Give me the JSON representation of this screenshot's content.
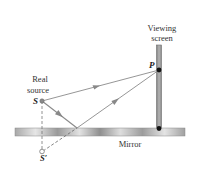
{
  "diagram": {
    "labels": {
      "viewing_screen_line1": "Viewing",
      "viewing_screen_line2": "screen",
      "real_source_line1": "Real",
      "real_source_line2": "source",
      "source": "S",
      "image_source": "S′",
      "point": "P",
      "mirror": "Mirror"
    },
    "elements": {
      "mirror": {
        "label": "Mirror",
        "x1": 15,
        "x2": 185,
        "y": 128,
        "thickness": 8
      },
      "screen": {
        "label": "Viewing screen",
        "x": 159,
        "y_top": 46,
        "y_bottom": 128
      },
      "source_S": {
        "x": 42,
        "y": 101
      },
      "image_S_prime": {
        "x": 42,
        "y": 152
      },
      "point_P": {
        "x": 159,
        "y": 70
      },
      "reflection_point": {
        "x": 77,
        "y": 128
      }
    },
    "rays": [
      {
        "name": "direct-ray",
        "from": "S",
        "to": "P",
        "style": "solid",
        "arrow": true
      },
      {
        "name": "incident-ray",
        "from": "S",
        "to": "reflection_point",
        "style": "solid",
        "arrow": true
      },
      {
        "name": "reflected-ray",
        "from": "reflection_point",
        "to": "P",
        "style": "solid",
        "arrow": true
      },
      {
        "name": "virtual-ray",
        "from": "S′",
        "to": "reflection_point",
        "style": "dashed",
        "arrow": false
      },
      {
        "name": "source-image-link",
        "from": "S",
        "to": "S′",
        "style": "dashed",
        "arrow": false
      }
    ],
    "colors": {
      "ray": "#8a8a8a",
      "screen": "#9a9a9a",
      "mirror_light": "#e8e8e8",
      "mirror_dark": "#8c8c8c",
      "dot": "#111111",
      "source_dot": "#888888",
      "text": "#333333"
    }
  }
}
